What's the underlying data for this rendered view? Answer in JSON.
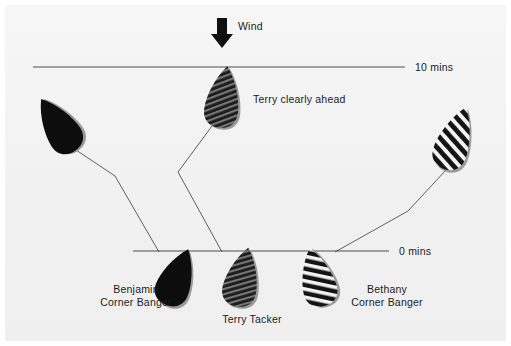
{
  "figure": {
    "domain": "sailing-tactics-diagram",
    "background_color": "#f2f2f2",
    "ink_color": "#1b1b1b",
    "line_color": "#3a3a3a"
  },
  "wind": {
    "label": "Wind",
    "arrow_icon": "wind-arrow-down-icon",
    "direction": "down",
    "x": 222,
    "y": 30
  },
  "time_lines": [
    {
      "id": "line-10-mins",
      "label": "10 mins",
      "y": 67,
      "x_start": 33,
      "x_end": 405
    },
    {
      "id": "line-0-mins",
      "label": "0 mins",
      "y": 251,
      "x_start": 133,
      "x_end": 389
    }
  ],
  "annotations": [
    {
      "id": "terry-clearly-ahead",
      "text": "Terry clearly ahead",
      "x": 253,
      "y": 93
    }
  ],
  "boats": [
    {
      "id": "boat-benjamin-top",
      "name": "Benjamin (10 mins position)",
      "fill": "solid-black",
      "x": 58,
      "y": 125,
      "rotation": -33,
      "width": 34,
      "height": 62
    },
    {
      "id": "boat-terry-top",
      "name": "Terry (10 mins position)",
      "fill": "fine-diagonal-hatch",
      "x": 223,
      "y": 97,
      "rotation": 8,
      "width": 34,
      "height": 62
    },
    {
      "id": "boat-bethany-top",
      "name": "Bethany (10 mins position)",
      "fill": "bold-diagonal-stripe",
      "x": 455,
      "y": 138,
      "rotation": 20,
      "width": 34,
      "height": 66
    },
    {
      "id": "boat-benjamin-start",
      "name": "Benjamin Corner Banger (start)",
      "fill": "solid-black",
      "x": 177,
      "y": 277,
      "rotation": 22,
      "width": 34,
      "height": 60
    },
    {
      "id": "boat-terry-start",
      "name": "Terry Tacker (start)",
      "fill": "fine-diagonal-hatch",
      "x": 242,
      "y": 277,
      "rotation": 12,
      "width": 34,
      "height": 60
    },
    {
      "id": "boat-bethany-start",
      "name": "Bethany Corner Banger (start)",
      "fill": "bold-diagonal-stripe",
      "x": 317,
      "y": 277,
      "rotation": -14,
      "width": 34,
      "height": 60
    }
  ],
  "boat_labels": [
    {
      "id": "label-benjamin",
      "line1": "Benjamin",
      "line2": "Corner Banger",
      "x": 136,
      "y": 283
    },
    {
      "id": "label-terry-tacker",
      "line1": "Terry Tacker",
      "line2": "",
      "x": 252,
      "y": 313
    },
    {
      "id": "label-bethany",
      "line1": "Bethany",
      "line2": "Corner Banger",
      "x": 387,
      "y": 283
    }
  ],
  "tracks": [
    {
      "id": "track-benjamin",
      "sailor": "Benjamin",
      "points": [
        [
          70,
          146
        ],
        [
          115,
          176
        ],
        [
          159,
          252
        ]
      ]
    },
    {
      "id": "track-terry",
      "sailor": "Terry",
      "points": [
        [
          212,
          126
        ],
        [
          178,
          172
        ],
        [
          222,
          252
        ]
      ]
    },
    {
      "id": "track-bethany",
      "sailor": "Bethany",
      "points": [
        [
          446,
          170
        ],
        [
          408,
          211
        ],
        [
          335,
          252
        ]
      ]
    }
  ]
}
